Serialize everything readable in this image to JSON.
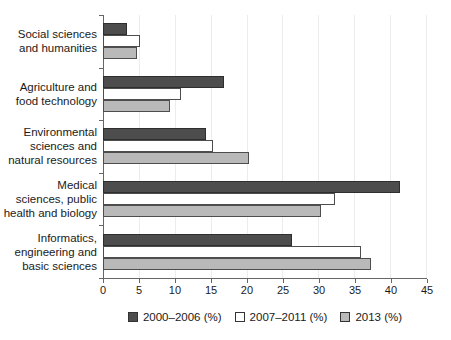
{
  "chart_data": {
    "type": "bar",
    "orientation": "horizontal",
    "title": "",
    "xlabel": "",
    "ylabel": "",
    "xlim": [
      0,
      45
    ],
    "xticks": [
      0,
      5,
      10,
      15,
      20,
      25,
      30,
      35,
      40,
      45
    ],
    "grid": "vertical-light",
    "legend_position": "bottom-center",
    "categories": [
      "Social sciences\nand humanities",
      "Agriculture and\nfood technology",
      "Environmental\nsciences and\nnatural resources",
      "Medical\nsciences, public\nhealth and biology",
      "Informatics,\nengineering and\nbasic sciences"
    ],
    "series": [
      {
        "name": "2000–2006 (%)",
        "fill": "#4d4d4d",
        "border": "#2e2e2e",
        "values": [
          3,
          16.5,
          14,
          41,
          26
        ]
      },
      {
        "name": "2007–2011 (%)",
        "fill": "#ffffff",
        "border": "#4d4d4d",
        "values": [
          4.8,
          10.5,
          15,
          32,
          35.5
        ]
      },
      {
        "name": "2013 (%)",
        "fill": "#b9b9b9",
        "border": "#4d4d4d",
        "values": [
          4.4,
          9,
          20,
          30,
          37
        ]
      }
    ],
    "colors": {
      "axis": "#666666",
      "gridline": "#ececec",
      "text": "#1a1a1a"
    }
  }
}
